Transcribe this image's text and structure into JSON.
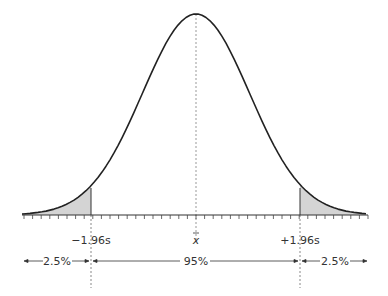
{
  "diagram": {
    "labels": {
      "left_bound": "−1.96s",
      "mean": "x̄",
      "right_bound": "+1.96s"
    },
    "regions": {
      "left_tail": "2.5%",
      "center": "95%",
      "right_tail": "2.5%"
    },
    "colors": {
      "curve": "#222222",
      "shade": "#d4d4d4",
      "axis": "#333333",
      "dashed": "#888888"
    },
    "geometry": {
      "center_x": 196,
      "peak_y": 14,
      "baseline_y": 215,
      "sigma_px": 53.5,
      "axis_start_x": 22,
      "axis_end_x": 368,
      "left_bound_x": 91,
      "right_bound_x": 300,
      "tick_spacing": 8.6
    }
  }
}
